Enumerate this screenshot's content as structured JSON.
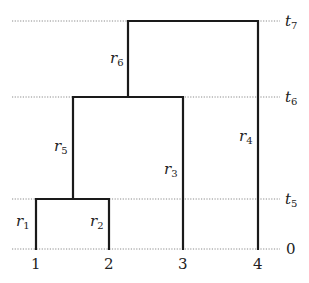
{
  "diagram": {
    "type": "dendrogram",
    "levels": [
      {
        "id": "t7",
        "label": "t",
        "sub": "7"
      },
      {
        "id": "t6",
        "label": "t",
        "sub": "6"
      },
      {
        "id": "t5",
        "label": "t",
        "sub": "5"
      },
      {
        "id": "zero",
        "label": "0"
      }
    ],
    "leaves": [
      "1",
      "2",
      "3",
      "4"
    ],
    "branches": [
      {
        "id": "r1",
        "label": "r",
        "sub": "1"
      },
      {
        "id": "r2",
        "label": "r",
        "sub": "2"
      },
      {
        "id": "r3",
        "label": "r",
        "sub": "3"
      },
      {
        "id": "r4",
        "label": "r",
        "sub": "4"
      },
      {
        "id": "r5",
        "label": "r",
        "sub": "5"
      },
      {
        "id": "r6",
        "label": "r",
        "sub": "6"
      }
    ],
    "colors": {
      "line": "#1a1a1a",
      "guide": "#8a8a8a"
    }
  }
}
